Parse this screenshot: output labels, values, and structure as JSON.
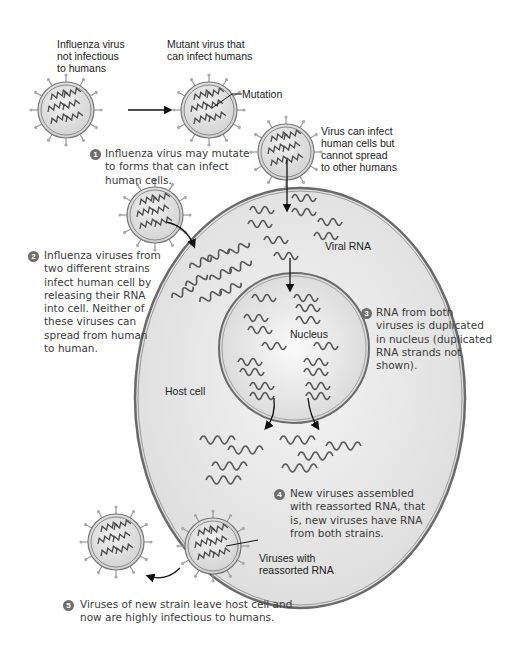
{
  "labels": {
    "virus_not_infectious": "Influenza virus\nnot infectious\nto humans",
    "mutant_virus": "Mutant virus that\ncan infect humans",
    "mutation": "Mutation",
    "virus_cannot_spread": "Virus can infect\nhuman cells but\ncannot spread\nto other humans",
    "viral_rna": "Viral RNA",
    "nucleus": "Nucleus",
    "host_cell": "Host cell",
    "reassorted_viruses": "Viruses with\nreassorted RNA"
  },
  "steps": [
    {
      "number": "1",
      "text": "Influenza virus may mutate\nto forms that can infect\nhuman cells."
    },
    {
      "number": "2",
      "text": "Influenza viruses from\ntwo different strains\ninfect human cell by\nreleasing their RNA\ninto cell. Neither of\nthese viruses can\nspread from human\nto human."
    },
    {
      "number": "3",
      "text": "RNA from both\nviruses is duplicated\nin nucleus (duplicated\nRNA strands not\nshown)."
    },
    {
      "number": "4",
      "text": "New viruses assembled\nwith reassorted RNA, that\nis, new viruses have RNA\nfrom both strains."
    },
    {
      "number": "5",
      "text": "Viruses of new strain leave host cell and\nnow are highly infectious to humans."
    }
  ],
  "colors": {
    "cell_fill": "#e6e6e6",
    "outline": "#6a6a6a",
    "rna": "#4a4a4a",
    "badge": "#6e6e6e"
  }
}
